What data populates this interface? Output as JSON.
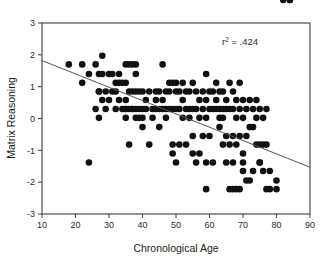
{
  "chart_data": {
    "type": "scatter",
    "title": "",
    "xlabel": "Chronological Age",
    "ylabel": "Matrix Reasoning",
    "xlim": [
      10,
      90
    ],
    "ylim": [
      -3,
      3
    ],
    "xticks": [
      10,
      20,
      30,
      40,
      50,
      60,
      70,
      80,
      90
    ],
    "yticks": [
      -3,
      -2,
      -1,
      0,
      1,
      2,
      3
    ],
    "xtick_labels": [
      "10",
      "20",
      "30",
      "40",
      "50",
      "60",
      "70",
      "80",
      "90"
    ],
    "ytick_labels": [
      "-3",
      "-2",
      "-1",
      "0",
      "1",
      "2",
      "3"
    ],
    "grid": false,
    "legend": null,
    "annotations": [
      {
        "name": "r-squared-annotation",
        "text_prefix": "r",
        "text_sup": "2",
        "text_suffix": " = .424",
        "full_text": "r2 = .424",
        "value": 0.424,
        "x": 70,
        "y": 2.45
      }
    ],
    "marker": {
      "shape": "circle",
      "color": "#111111",
      "size_px": 3.3
    },
    "trendline": {
      "name": "regression-line",
      "type": "linear",
      "color": "#555555",
      "x_start": 10,
      "y_start": 1.82,
      "x_end": 90,
      "y_end": -1.53,
      "slope": -0.0419,
      "intercept": 2.239
    },
    "x": [
      18,
      22,
      22,
      24,
      24,
      26,
      26,
      27,
      27,
      27,
      27,
      28,
      28,
      28,
      29,
      29,
      30,
      30,
      31,
      31,
      32,
      32,
      32,
      33,
      33,
      33,
      34,
      34,
      35,
      35,
      35,
      35,
      35,
      35,
      36,
      36,
      36,
      36,
      37,
      37,
      37,
      37,
      38,
      38,
      38,
      38,
      38,
      39,
      39,
      39,
      40,
      40,
      40,
      40,
      41,
      41,
      42,
      42,
      43,
      43,
      44,
      44,
      44,
      45,
      45,
      45,
      46,
      46,
      46,
      47,
      47,
      47,
      48,
      48,
      48,
      49,
      49,
      49,
      49,
      50,
      50,
      50,
      50,
      51,
      51,
      51,
      52,
      52,
      52,
      53,
      53,
      53,
      54,
      54,
      54,
      55,
      55,
      55,
      55,
      56,
      56,
      56,
      57,
      57,
      57,
      58,
      58,
      58,
      59,
      59,
      59,
      59,
      59,
      60,
      60,
      60,
      61,
      61,
      61,
      62,
      62,
      62,
      63,
      63,
      63,
      63,
      64,
      64,
      64,
      64,
      65,
      65,
      65,
      65,
      66,
      66,
      66,
      66,
      67,
      67,
      67,
      67,
      67,
      68,
      68,
      68,
      68,
      69,
      69,
      69,
      69,
      70,
      70,
      70,
      70,
      70,
      71,
      71,
      71,
      72,
      72,
      72,
      73,
      73,
      73,
      74,
      74,
      74,
      75,
      75,
      75,
      75,
      76,
      76,
      76,
      77,
      77,
      77,
      78,
      78,
      80,
      80,
      82,
      84,
      84
    ],
    "y": [
      1.7,
      1.7,
      1.12,
      1.4,
      -1.38,
      1.7,
      0.3,
      1.4,
      0.85,
      0.85,
      0.02,
      1.97,
      1.4,
      0.58,
      0.85,
      0.3,
      1.4,
      0.58,
      1.4,
      0.85,
      1.12,
      0.85,
      0.3,
      1.4,
      1.12,
      0.58,
      1.12,
      0.3,
      1.7,
      1.12,
      0.58,
      0.3,
      0.3,
      0.02,
      1.7,
      0.85,
      0.3,
      -0.82,
      1.7,
      0.85,
      0.3,
      0.3,
      1.7,
      1.4,
      0.85,
      0.3,
      0.02,
      0.85,
      0.3,
      0.02,
      0.85,
      0.3,
      0.02,
      -0.27,
      0.58,
      0.3,
      0.85,
      -0.82,
      0.3,
      0.02,
      0.85,
      0.58,
      0.3,
      0.85,
      0.3,
      -0.27,
      1.7,
      0.58,
      0.3,
      0.85,
      0.3,
      0.02,
      1.12,
      0.85,
      0.3,
      1.12,
      0.3,
      -0.82,
      -1.1,
      1.12,
      0.85,
      0.3,
      -1.38,
      0.85,
      0.3,
      -0.82,
      1.12,
      0.58,
      0.02,
      0.85,
      0.3,
      -0.82,
      0.85,
      0.3,
      0.02,
      1.12,
      0.3,
      -0.55,
      -1.1,
      0.85,
      0.3,
      -1.38,
      0.58,
      0.02,
      -1.1,
      0.85,
      0.3,
      -0.55,
      1.4,
      0.58,
      0.02,
      -1.38,
      -2.22,
      0.85,
      0.3,
      -0.55,
      0.85,
      0.3,
      -1.38,
      1.12,
      0.58,
      0.3,
      -0.27,
      0.85,
      0.3,
      0.02,
      -0.82,
      0.85,
      0.3,
      0.02,
      -1.38,
      0.58,
      0.3,
      -0.55,
      -2.22,
      1.12,
      0.3,
      -0.82,
      -1.38,
      -2.22,
      0.85,
      0.3,
      -0.55,
      -2.22,
      0.58,
      0.02,
      -0.82,
      -2.22,
      1.12,
      0.3,
      -0.55,
      -1.1,
      -1.65,
      0.58,
      0.02,
      -1.38,
      0.3,
      -0.55,
      -1.95,
      0.58,
      -0.27,
      -1.95,
      0.3,
      -0.27,
      -1.65,
      0.58,
      0.02,
      -0.82,
      -1.38,
      0.3,
      -0.82,
      -1.38,
      0.02,
      -0.82,
      -1.65,
      -0.82,
      -2.22,
      0.3,
      -2.22,
      -1.65,
      -1.95,
      -2.22
    ]
  }
}
